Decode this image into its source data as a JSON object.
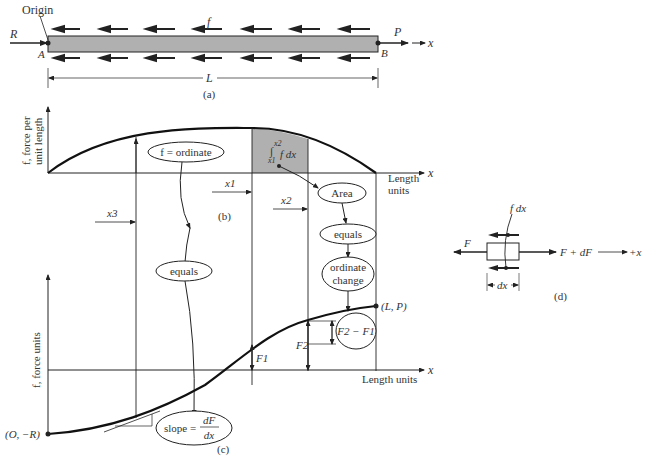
{
  "panel_a": {
    "origin_label": "Origin",
    "load_label": "f",
    "left_force": "R",
    "right_force": "P",
    "left_end": "A",
    "right_end": "B",
    "axis_label": "x",
    "length_label": "L",
    "caption": "(a)",
    "bar_color": "#b0b0b0"
  },
  "panel_b": {
    "ylabel_line1": "f, force per",
    "ylabel_line2": "unit length",
    "xlabel_line1": "Length",
    "xlabel_line2": "units",
    "axis_label": "x",
    "ordinate_bubble": "f = ordinate",
    "integral_upper": "x2",
    "integral_lower": "x1",
    "integrand": "f dx",
    "area_bubble": "Area",
    "x1": "x1",
    "x2": "x2",
    "x3": "x3",
    "caption": "(b)",
    "area_color": "#b0b0b0"
  },
  "flow": {
    "equals_left": "equals",
    "equals_right": "equals",
    "ordinate_change_line1": "ordinate",
    "ordinate_change_line2": "change"
  },
  "panel_c": {
    "ylabel": "f, force units",
    "xlabel": "Length units",
    "axis_label": "x",
    "start_point": "(O, −R)",
    "end_point": "(L, P)",
    "F1": "F1",
    "F2": "F2",
    "diff_bubble": "F2 − F1",
    "slope_prefix": "slope =",
    "slope_num": "dF",
    "slope_den": "dx",
    "caption": "(c)"
  },
  "panel_d": {
    "load_label": "f dx",
    "left_force": "F",
    "right_force": "F + dF",
    "direction_label": "+x",
    "width_label": "dx",
    "caption": "(d)"
  }
}
